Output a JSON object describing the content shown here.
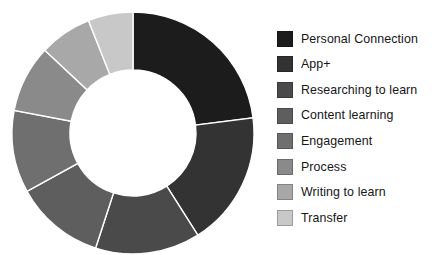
{
  "chart_data": {
    "type": "pie",
    "variant": "donut",
    "title": "",
    "subtitle": "",
    "xlabel": "",
    "ylabel": "",
    "grid": false,
    "legend_position": "right",
    "start_angle_deg": 0,
    "direction": "clockwise",
    "inner_radius_ratio": 0.52,
    "center_px": {
      "x": 133,
      "y": 133
    },
    "outer_radius_px": 121,
    "inner_radius_px": 63,
    "categories": [
      "Personal Connection",
      "App+",
      "Researching to learn",
      "Content learning",
      "Engagement",
      "Process",
      "Writing to learn",
      "Transfer"
    ],
    "values": [
      23,
      18,
      14,
      12,
      11,
      9,
      7,
      6
    ],
    "unit": "percent",
    "colors": [
      "#1c1c1c",
      "#333333",
      "#4a4a4a",
      "#5e5e5e",
      "#6f6f6f",
      "#8a8a8a",
      "#a8a8a8",
      "#c8c8c8"
    ]
  },
  "legend": {
    "items": [
      {
        "label": "Personal Connection",
        "color": "#1c1c1c",
        "value": 23
      },
      {
        "label": "App+",
        "color": "#333333",
        "value": 18
      },
      {
        "label": "Researching to learn",
        "color": "#4a4a4a",
        "value": 14
      },
      {
        "label": "Content learning",
        "color": "#5e5e5e",
        "value": 12
      },
      {
        "label": "Engagement",
        "color": "#6f6f6f",
        "value": 11
      },
      {
        "label": "Process",
        "color": "#8a8a8a",
        "value": 9
      },
      {
        "label": "Writing to learn",
        "color": "#a8a8a8",
        "value": 7
      },
      {
        "label": "Transfer",
        "color": "#c8c8c8",
        "value": 6
      }
    ]
  }
}
